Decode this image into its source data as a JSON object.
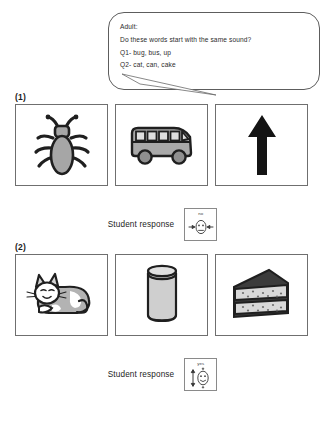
{
  "worksheet": {
    "prompt_bubble": {
      "speaker": "Adult:",
      "lines": [
        "Do these words start with the same sound?",
        "Q1- bug, bus, up",
        "Q2- cat, can, cake"
      ]
    },
    "items": [
      {
        "number": "(1)",
        "pictures": [
          {
            "label": "bug",
            "icon": "bug-icon"
          },
          {
            "label": "bus",
            "icon": "bus-icon"
          },
          {
            "label": "up",
            "icon": "up-arrow-icon"
          }
        ],
        "response": {
          "label": "Student response",
          "card_text": "no",
          "card_icon": "no-face-converging-arrows-icon"
        }
      },
      {
        "number": "(2)",
        "pictures": [
          {
            "label": "cat",
            "icon": "cat-icon"
          },
          {
            "label": "can",
            "icon": "can-icon"
          },
          {
            "label": "cake",
            "icon": "cake-slice-icon"
          }
        ],
        "response": {
          "label": "Student response",
          "card_text": "yes",
          "card_icon": "yes-face-vertical-arrow-icon"
        }
      }
    ],
    "colors": {
      "ink": "#222222",
      "border": "#6f6f6f",
      "fill_gray": "#a6a6a6",
      "fill_light": "#d4d4d4",
      "dark": "#3a3a3a"
    }
  }
}
